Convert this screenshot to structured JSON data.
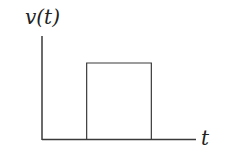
{
  "diagram": {
    "type": "rectangular-pulse-waveform",
    "y_label": "v(t)",
    "x_label": "t",
    "line_color": "#3a3a3a",
    "pulse": {
      "baseline_level": 0,
      "high_level": 1,
      "start_fraction_of_axis": 0.29,
      "end_fraction_of_axis": 0.71
    }
  }
}
